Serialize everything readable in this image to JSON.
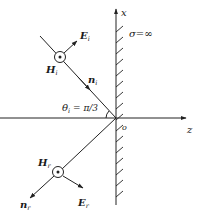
{
  "diagram": {
    "axes": {
      "x_label": "x",
      "z_label": "z",
      "origin_label": "o"
    },
    "conductor": {
      "label": "σ=∞"
    },
    "incident": {
      "E_label": "E",
      "E_sub": "i",
      "H_label": "H",
      "H_sub": "i",
      "n_label": "n",
      "n_sub": "i",
      "angle_label": "θ",
      "angle_sub": "i",
      "angle_value": " = π/3"
    },
    "reflected": {
      "E_label": "E",
      "E_sub": "r",
      "H_label": "H",
      "H_sub": "r",
      "n_label": "n",
      "n_sub": "r"
    },
    "colors": {
      "ink": "#222222",
      "background": "#ffffff"
    }
  }
}
